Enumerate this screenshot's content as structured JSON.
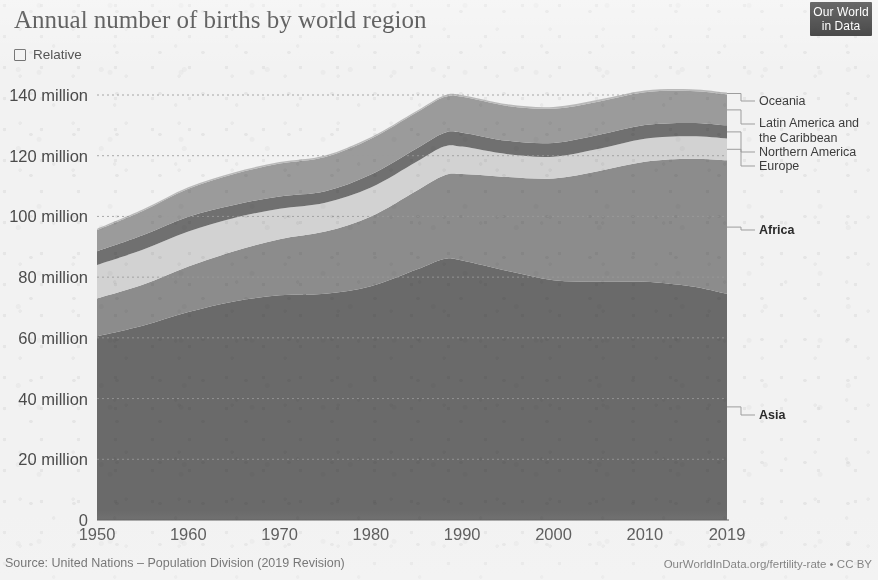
{
  "header": {
    "title": "Annual number of births by world region",
    "relative_label": "Relative",
    "relative_checked": false,
    "logo_line1": "Our World",
    "logo_line2": "in Data"
  },
  "footer": {
    "source": "Source: United Nations – Population Division (2019 Revision)",
    "attribution": "OurWorldInData.org/fertility-rate • CC BY"
  },
  "chart_data": {
    "type": "area",
    "stacked": true,
    "title": "Annual number of births by world region",
    "xlabel": "",
    "ylabel": "",
    "xlim": [
      1950,
      2019
    ],
    "ylim": [
      0,
      140
    ],
    "units": "million births per year",
    "grid": "horizontal-dotted",
    "legend_position": "right-inline",
    "xticks": [
      1950,
      1960,
      1970,
      1980,
      1990,
      2000,
      2010,
      2019
    ],
    "xtick_labels": [
      "1950",
      "1960",
      "1970",
      "1980",
      "1990",
      "2000",
      "2010",
      "2019"
    ],
    "yticks": [
      0,
      20,
      40,
      60,
      80,
      100,
      120,
      140
    ],
    "ytick_labels": [
      "0",
      "20 million",
      "40 million",
      "60 million",
      "80 million",
      "100 million",
      "120 million",
      "140 million"
    ],
    "x": [
      1950,
      1955,
      1960,
      1965,
      1970,
      1975,
      1980,
      1985,
      1988,
      1990,
      1995,
      2000,
      2005,
      2010,
      2015,
      2019
    ],
    "series": [
      {
        "name": "Asia",
        "color": "#6a6a6a",
        "values": [
          60.5,
          64.0,
          68.5,
          72.0,
          74.0,
          74.5,
          77.0,
          82.5,
          86.0,
          85.5,
          82.0,
          79.0,
          78.5,
          78.5,
          77.0,
          74.5
        ]
      },
      {
        "name": "Africa",
        "color": "#8c8c8c",
        "values": [
          12.5,
          13.5,
          15.0,
          16.5,
          18.5,
          20.5,
          23.0,
          26.0,
          27.5,
          28.5,
          31.0,
          33.5,
          36.5,
          39.5,
          42.0,
          44.0
        ]
      },
      {
        "name": "Europe",
        "color": "#d2d2d2",
        "values": [
          11.0,
          11.5,
          11.5,
          11.0,
          10.0,
          9.5,
          9.5,
          9.5,
          9.5,
          9.0,
          7.5,
          7.2,
          7.3,
          7.6,
          7.4,
          7.2
        ]
      },
      {
        "name": "Northern America",
        "color": "#707070",
        "values": [
          4.5,
          4.8,
          4.9,
          4.3,
          4.1,
          3.8,
          4.3,
          4.4,
          4.5,
          4.6,
          4.4,
          4.5,
          4.6,
          4.5,
          4.4,
          4.3
        ]
      },
      {
        "name": "Latin America and the Caribbean",
        "color": "#9b9b9b",
        "values": [
          7.0,
          8.0,
          9.2,
          10.2,
          10.8,
          11.3,
          11.8,
          11.8,
          11.8,
          11.8,
          11.5,
          11.3,
          11.0,
          10.8,
          10.5,
          10.2
        ]
      },
      {
        "name": "Oceania",
        "color": "#b9b9b9",
        "values": [
          0.4,
          0.45,
          0.5,
          0.5,
          0.5,
          0.5,
          0.5,
          0.5,
          0.5,
          0.55,
          0.55,
          0.55,
          0.6,
          0.6,
          0.62,
          0.62
        ]
      }
    ],
    "legend_entries": [
      {
        "label": "Oceania",
        "color": "#b9b9b9"
      },
      {
        "label": "Latin America and the Caribbean",
        "color": "#9b9b9b"
      },
      {
        "label": "Northern America",
        "color": "#707070"
      },
      {
        "label": "Europe",
        "color": "#d2d2d2"
      },
      {
        "label": "Africa",
        "color": "#8c8c8c"
      },
      {
        "label": "Asia",
        "color": "#6a6a6a"
      }
    ]
  }
}
